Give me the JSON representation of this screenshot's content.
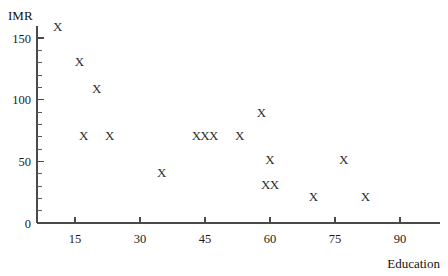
{
  "chart_data": {
    "type": "scatter",
    "title": "",
    "xlabel": "Education",
    "ylabel": "IMR",
    "marker": "X",
    "grid": false,
    "legend": null,
    "xlim": [
      5,
      95
    ],
    "ylim": [
      0,
      162
    ],
    "xticks": [
      15,
      30,
      45,
      60,
      75,
      90
    ],
    "yticks": [
      0,
      50,
      100,
      150
    ],
    "y_minor_tick_step": 10,
    "xtick_labels": [
      "15",
      "30",
      "45",
      "60",
      "75",
      "90"
    ],
    "ytick_labels": [
      "0",
      "50",
      "100",
      "150"
    ],
    "points": [
      {
        "x": 11,
        "y": 158
      },
      {
        "x": 16,
        "y": 130
      },
      {
        "x": 20,
        "y": 108
      },
      {
        "x": 17,
        "y": 70
      },
      {
        "x": 23,
        "y": 70
      },
      {
        "x": 35,
        "y": 40
      },
      {
        "x": 43,
        "y": 70
      },
      {
        "x": 45,
        "y": 70
      },
      {
        "x": 47,
        "y": 70
      },
      {
        "x": 53,
        "y": 70
      },
      {
        "x": 58,
        "y": 88
      },
      {
        "x": 60,
        "y": 50
      },
      {
        "x": 59,
        "y": 30
      },
      {
        "x": 61,
        "y": 30
      },
      {
        "x": 70,
        "y": 20
      },
      {
        "x": 77,
        "y": 50
      },
      {
        "x": 82,
        "y": 20
      }
    ]
  },
  "colors": {
    "axis": "#4a4a4a",
    "marker": "#2b2b2b",
    "text": "#1a1a1a",
    "background": "#ffffff"
  },
  "axes": {
    "y_title": "IMR",
    "x_title": "Education"
  }
}
